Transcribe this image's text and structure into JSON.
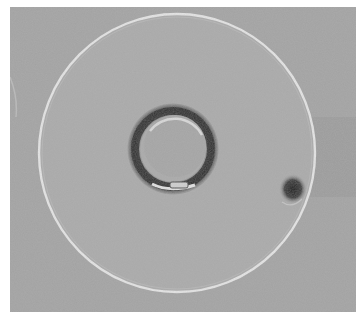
{
  "image": {
    "description": "Grayscale micrograph of a large circular disc with a central ring-shaped feature and a small dark spot near the right edge",
    "colors": {
      "background": "#a3a3a3",
      "disc_fill": "#a6a6a6",
      "disc_rim": "#e4e4e4",
      "ring_dark": "#2e2e2e",
      "ring_light": "#d8d8d8",
      "spot": "#252525",
      "margin": "#ffffff"
    }
  }
}
